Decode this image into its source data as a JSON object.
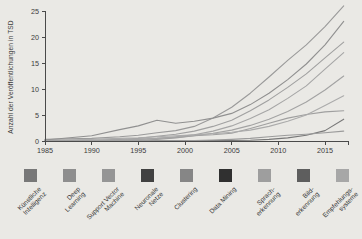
{
  "chart_data": {
    "type": "line",
    "title": "",
    "ylabel": "Anzahl der Veröffentlichungen in TSD",
    "xlabel": "",
    "grid": false,
    "legend_position": "bottom",
    "xlim": [
      1985,
      2017.5
    ],
    "ylim": [
      0,
      25
    ],
    "x_ticks": [
      1985,
      1990,
      1995,
      2000,
      2005,
      2010,
      2015
    ],
    "y_ticks": [
      0,
      5,
      10,
      15,
      20,
      25
    ],
    "x": [
      1985,
      1990,
      1993,
      1995,
      1997,
      1999,
      2001,
      2003,
      2005,
      2007,
      2009,
      2011,
      2013,
      2015,
      2017
    ],
    "series": [
      {
        "name": "Künstliche Intelligenz",
        "label": "Künstliche\nIntelligenz",
        "swatch_color": "#787878",
        "line_color": "#9a9a9a",
        "values": [
          0.3,
          0.5,
          0.8,
          1.1,
          1.6,
          2.0,
          2.8,
          4.4,
          6.5,
          9.2,
          12.3,
          15.5,
          18.5,
          22,
          26
        ]
      },
      {
        "name": "Deep Learning",
        "label": "Deep\nLearning",
        "swatch_color": "#8e8e8e",
        "line_color": "#787878",
        "values": [
          0,
          0,
          0,
          0,
          0.02,
          0.05,
          0.05,
          0.1,
          0.1,
          0.15,
          0.3,
          0.6,
          1.1,
          2.0,
          4.2
        ]
      },
      {
        "name": "Support Vector Machine",
        "label": "Support Vector\nMachine",
        "swatch_color": "#959595",
        "line_color": "#9f9f9f",
        "values": [
          0,
          0,
          0.05,
          0.1,
          0.3,
          0.6,
          1.0,
          1.2,
          1.5,
          2.4,
          3.4,
          4.4,
          5.1,
          5.6,
          5.8
        ]
      },
      {
        "name": "Neuronale Netze",
        "label": "Neuronale\nNetze",
        "swatch_color": "#414141",
        "line_color": "#909090",
        "values": [
          0.2,
          1.0,
          2.2,
          2.9,
          4.0,
          3.4,
          3.8,
          4.4,
          5.3,
          7.0,
          9.2,
          11.8,
          14.8,
          18.5,
          23
        ]
      },
      {
        "name": "Clustering",
        "label": "Clustering",
        "swatch_color": "#868686",
        "line_color": "#a3a3a3",
        "values": [
          0,
          0.1,
          0.2,
          0.3,
          0.5,
          0.7,
          1.0,
          1.5,
          2.1,
          3.0,
          4.2,
          5.7,
          7.5,
          9.8,
          12.5
        ]
      },
      {
        "name": "Data Mining",
        "label": "Data Mining",
        "swatch_color": "#303030",
        "line_color": "#a0a0a0",
        "values": [
          0,
          0.1,
          0.3,
          0.5,
          0.9,
          1.3,
          1.9,
          2.8,
          4.0,
          5.8,
          7.9,
          10.3,
          12.9,
          16,
          19
        ]
      },
      {
        "name": "Spracherkennung",
        "label": "Sprach-\nerkennung",
        "swatch_color": "#9e9e9e",
        "line_color": "#ababab",
        "values": [
          0.1,
          0.3,
          0.5,
          0.6,
          0.8,
          1.0,
          1.2,
          1.4,
          1.7,
          2.1,
          2.8,
          3.8,
          5.0,
          6.8,
          8.7
        ]
      },
      {
        "name": "Bilderkennung",
        "label": "Bild-\nerkennung",
        "swatch_color": "#5e5e5e",
        "line_color": "#a6a6a6",
        "values": [
          0,
          0.1,
          0.2,
          0.3,
          0.5,
          0.8,
          1.2,
          1.9,
          2.9,
          4.3,
          6.0,
          8.2,
          10.6,
          13.8,
          17
        ]
      },
      {
        "name": "Empfehlungssysteme",
        "label": "Empfehlungs-\nsysteme",
        "swatch_color": "#a7a7a7",
        "line_color": "#9b9b9b",
        "values": [
          0,
          0,
          0,
          0,
          0.02,
          0.05,
          0.1,
          0.2,
          0.3,
          0.5,
          0.8,
          1.1,
          1.3,
          1.6,
          1.9
        ]
      }
    ]
  },
  "style": {
    "page_bg": "#eae9e5",
    "axis_color": "#4a4a4a",
    "tick_label_color": "#3a3a3a"
  }
}
